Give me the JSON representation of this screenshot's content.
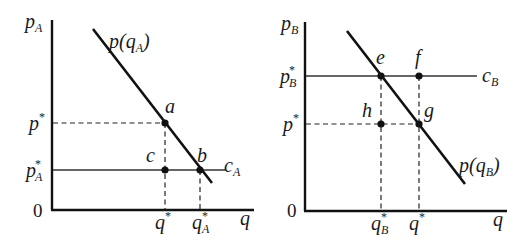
{
  "panels": [
    {
      "id": "A",
      "y_axis_label": {
        "base": "p",
        "sub": "A"
      },
      "x_axis_label": "q",
      "origin_label": "0",
      "demand_label": {
        "text": "p(q",
        "sub": "A",
        "close": ")"
      },
      "cost_label": {
        "base": "c",
        "sub": "A"
      },
      "y_ticks": [
        {
          "base": "p",
          "sup": "*",
          "sub": ""
        },
        {
          "base": "p",
          "sup": "*",
          "sub": "A"
        }
      ],
      "x_ticks": [
        {
          "base": "q",
          "sup": "*",
          "sub": ""
        },
        {
          "base": "q",
          "sup": "*",
          "sub": "A"
        }
      ],
      "points": [
        "a",
        "c",
        "b"
      ]
    },
    {
      "id": "B",
      "y_axis_label": {
        "base": "p",
        "sub": "B"
      },
      "x_axis_label": "q",
      "origin_label": "0",
      "demand_label": {
        "text": "p(q",
        "sub": "B",
        "close": ")"
      },
      "cost_label": {
        "base": "c",
        "sub": "B"
      },
      "y_ticks": [
        {
          "base": "p",
          "sup": "*",
          "sub": "B"
        },
        {
          "base": "p",
          "sup": "*",
          "sub": ""
        }
      ],
      "x_ticks": [
        {
          "base": "q",
          "sup": "*",
          "sub": "B"
        },
        {
          "base": "q",
          "sup": "*",
          "sub": ""
        }
      ],
      "points": [
        "e",
        "f",
        "h",
        "g"
      ]
    }
  ]
}
